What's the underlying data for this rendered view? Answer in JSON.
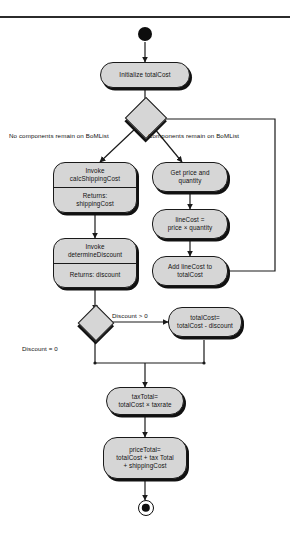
{
  "diagram": {
    "type": "uml-activity-diagram",
    "colors": {
      "node_fill": "#d6d6d6",
      "node_stroke": "#1a1a1a",
      "shadow": "#111111",
      "edge": "#1a1a1a",
      "background": "#ffffff"
    },
    "nodes": {
      "start": {
        "name": "initial-node",
        "label": ""
      },
      "initialize": {
        "label": "Initialize totalCost"
      },
      "decision_bom": {
        "label": ""
      },
      "invoke_shipping": {
        "call": "Invoke\ncalcShippingCost",
        "call_line1": "Invoke",
        "call_line2": "calcShippingCost",
        "returns": "Returns:\nshippingCost",
        "returns_line1": "Returns:",
        "returns_line2": "shippingCost"
      },
      "invoke_discount": {
        "call_line1": "Invoke",
        "call_line2": "determineDiscount",
        "returns_line1": "Returns: discount"
      },
      "get_price": {
        "line1": "Get price and",
        "line2": "quantity"
      },
      "line_cost": {
        "line1": "lineCost =",
        "line2": "price × quantity"
      },
      "add_line_cost": {
        "line1": "Add lineCost to",
        "line2": "totalCost"
      },
      "decision_discount": {
        "label": ""
      },
      "apply_discount": {
        "line1": "totalCost=",
        "line2": "totalCost - discount"
      },
      "tax_total": {
        "line1": "taxTotal=",
        "line2": "totalCost × taxrate"
      },
      "price_total": {
        "line1": "priceTotal=",
        "line2": "totalCost + tax Total",
        "line3": "+ shippingCost"
      },
      "end": {
        "name": "final-node",
        "label": ""
      }
    },
    "edge_labels": {
      "no_components": "No components remain on BoMList",
      "components_remain": "Components remain on BoMList",
      "discount_gt_zero": "Discount > 0",
      "discount_eq_zero": "Discount = 0"
    }
  }
}
